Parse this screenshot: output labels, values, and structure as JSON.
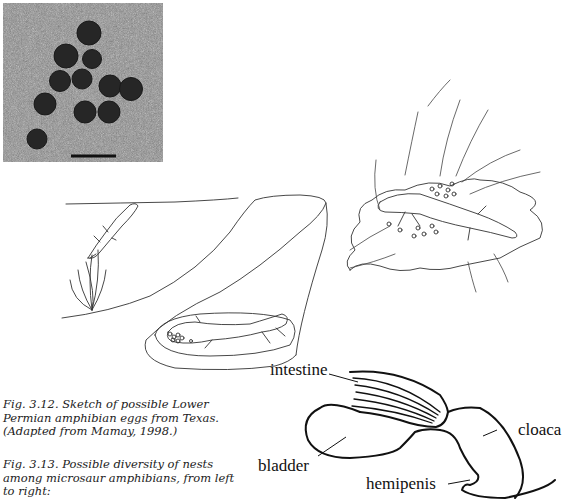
{
  "figure_3_12": {
    "caption": "Fig. 3.12. Sketch of possible Lower Permian amphibian eggs from Texas. (Adapted from Mamay, 1998.)",
    "eggs": [
      {
        "cx": 86,
        "cy": 30,
        "r": 12
      },
      {
        "cx": 63,
        "cy": 53,
        "r": 12
      },
      {
        "cx": 89,
        "cy": 56,
        "r": 9.5
      },
      {
        "cx": 57,
        "cy": 78,
        "r": 10.5
      },
      {
        "cx": 79,
        "cy": 76,
        "r": 10
      },
      {
        "cx": 107,
        "cy": 83,
        "r": 11
      },
      {
        "cx": 128,
        "cy": 86,
        "r": 11.5
      },
      {
        "cx": 42,
        "cy": 101,
        "r": 11
      },
      {
        "cx": 82,
        "cy": 109,
        "r": 11
      },
      {
        "cx": 106,
        "cy": 109,
        "r": 11
      },
      {
        "cx": 34,
        "cy": 136,
        "r": 10
      }
    ],
    "scale_bar": {
      "x1": 68,
      "x2": 113,
      "y": 153
    }
  },
  "figure_3_13": {
    "caption": "Fig. 3.13. Possible diversity of nests among microsaur amphibians, from left to right:"
  },
  "anatomy_labels": {
    "intestine": "intestine",
    "bladder": "bladder",
    "cloaca": "cloaca",
    "hemipenis": "hemipenis"
  }
}
